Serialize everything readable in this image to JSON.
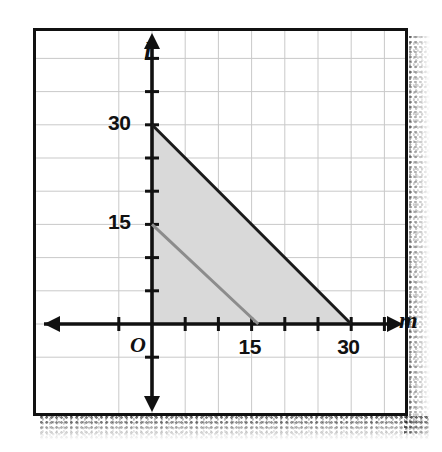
{
  "figure": {
    "title": "",
    "x_axis_label": "m",
    "y_axis_label": "l",
    "origin_label": "O",
    "x_tick_labels": [
      "15",
      "30"
    ],
    "y_tick_labels": [
      "30",
      "15"
    ]
  },
  "chart_data": {
    "type": "line",
    "title": "",
    "xlabel": "m",
    "ylabel": "l",
    "xlim": [
      -5,
      40
    ],
    "ylim": [
      -5,
      40
    ],
    "xticks": [
      0,
      5,
      10,
      15,
      20,
      25,
      30,
      35
    ],
    "yticks": [
      0,
      5,
      10,
      15,
      20,
      25,
      30,
      35
    ],
    "xtick_labels_shown": {
      "15": "15",
      "30": "30"
    },
    "ytick_labels_shown": {
      "15": "15",
      "30": "30"
    },
    "grid": true,
    "grid_spacing": 5,
    "grid_color": "#c9c9c9",
    "legend": "none",
    "series": [
      {
        "name": "boundary-line-dark",
        "style": "solid",
        "color": "#1a1a1a",
        "width": 3,
        "points": [
          [
            0,
            30
          ],
          [
            30,
            0
          ]
        ],
        "equation": "l = 30 - m"
      },
      {
        "name": "boundary-line-gray",
        "style": "solid",
        "color": "#8c8c8c",
        "width": 3,
        "points": [
          [
            0,
            15
          ],
          [
            16,
            0
          ]
        ],
        "equation": "l = 15 - (15/16)m"
      }
    ],
    "shaded_regions": [
      {
        "name": "feasible-region",
        "fill": "#d9d9d9",
        "vertices": [
          [
            0,
            0
          ],
          [
            0,
            30
          ],
          [
            30,
            0
          ]
        ],
        "description": "Triangular region bounded by the m-axis, the l-axis and the line through (0,30) and (30,0)"
      }
    ],
    "annotations": [
      {
        "text": "O",
        "x": -2.2,
        "y": -3.0,
        "role": "origin-label"
      },
      {
        "text": "m",
        "x": 38.5,
        "y": 0.4,
        "role": "x-axis-label"
      },
      {
        "text": "l",
        "x": -1.4,
        "y": 39.0,
        "role": "y-axis-label"
      }
    ]
  },
  "geometry": {
    "origin_px": {
      "x": 116,
      "y": 293
    },
    "unit_px_per_5": 33.2,
    "plot_width": 369,
    "plot_height": 382
  }
}
